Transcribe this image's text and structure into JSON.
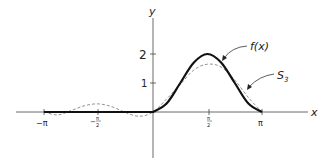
{
  "chart_data": {
    "type": "line",
    "title": "",
    "xlabel": "x",
    "ylabel": "y",
    "xlim": [
      -3.3,
      3.5
    ],
    "ylim": [
      -0.9,
      2.9
    ],
    "grid": false,
    "x_ticks": [
      {
        "value": -3.14159,
        "label": "−π"
      },
      {
        "value": -1.5708,
        "label": "−π/2"
      },
      {
        "value": 1.5708,
        "label": "π/2"
      },
      {
        "value": 3.14159,
        "label": "π"
      }
    ],
    "y_ticks": [
      {
        "value": 1,
        "label": "1"
      },
      {
        "value": 2,
        "label": "2"
      }
    ],
    "series": [
      {
        "name": "f(x)",
        "style": "solid-thick",
        "definition": "f(x) = 0 for −π ≤ x < 0; 1 − cos 2x for 0 ≤ x ≤ π",
        "x": [
          -3.1416,
          -0.0001,
          0,
          0.3927,
          0.7854,
          1.1781,
          1.5708,
          1.9635,
          2.3562,
          2.7489,
          3.1416
        ],
        "values": [
          0,
          0,
          0,
          0.293,
          1.0,
          1.707,
          2.0,
          1.707,
          1.0,
          0.293,
          0
        ]
      },
      {
        "name": "S_3",
        "style": "dashed-thin",
        "definition": "partial Fourier sum approximating f(x)",
        "x": [
          -3.1416,
          -2.7489,
          -2.3562,
          -1.9635,
          -1.5708,
          -1.1781,
          -0.7854,
          -0.3927,
          0,
          0.3927,
          0.7854,
          1.1781,
          1.5708,
          1.9635,
          2.3562,
          2.7489,
          3.1416
        ],
        "values": [
          0,
          -0.1,
          0.05,
          0.22,
          0.28,
          0.18,
          -0.02,
          -0.15,
          0,
          0.45,
          0.95,
          1.45,
          1.65,
          1.55,
          1.1,
          0.5,
          0
        ]
      }
    ],
    "annotations": [
      {
        "text": "f(x)",
        "points_to": "f(x) curve near x≈2.0"
      },
      {
        "text": "S₃",
        "points_to": "S_3 curve near x≈2.6"
      }
    ]
  },
  "labels": {
    "y_axis": "y",
    "x_axis": "x",
    "tick_neg_pi": "−π",
    "tick_neg_half_num": "π",
    "tick_neg_half_den": "2",
    "tick_half_num": "π",
    "tick_half_den": "2",
    "tick_pi": "π",
    "tick_1": "1",
    "tick_2": "2",
    "fx": "f(x)",
    "s3_main": "S",
    "s3_sub": "3",
    "neg_sign": "−"
  },
  "layout": {
    "origin_px": [
      153,
      112
    ],
    "px_per_unit_x": 34.7,
    "px_per_unit_y": 29
  }
}
